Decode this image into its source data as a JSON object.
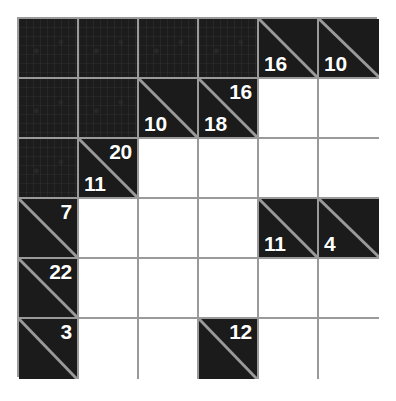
{
  "puzzle": {
    "type": "kakuro",
    "rows": 6,
    "cols": 6,
    "colors": {
      "block": "#1b1b1b",
      "cell": "#ffffff",
      "grid_line": "#9a9a9a",
      "clue_text": "#ffffff",
      "page_background": "#ffffff"
    },
    "grid": [
      [
        {
          "kind": "block",
          "across": "",
          "down": ""
        },
        {
          "kind": "block",
          "across": "",
          "down": ""
        },
        {
          "kind": "block",
          "across": "",
          "down": ""
        },
        {
          "kind": "block",
          "across": "",
          "down": ""
        },
        {
          "kind": "clue",
          "across": "",
          "down": "16"
        },
        {
          "kind": "clue",
          "across": "",
          "down": "10"
        }
      ],
      [
        {
          "kind": "block",
          "across": "",
          "down": ""
        },
        {
          "kind": "block",
          "across": "",
          "down": ""
        },
        {
          "kind": "clue",
          "across": "",
          "down": "10"
        },
        {
          "kind": "clue",
          "across": "16",
          "down": "18"
        },
        {
          "kind": "entry",
          "across": "",
          "down": ""
        },
        {
          "kind": "entry",
          "across": "",
          "down": ""
        }
      ],
      [
        {
          "kind": "block",
          "across": "",
          "down": ""
        },
        {
          "kind": "clue",
          "across": "20",
          "down": "11"
        },
        {
          "kind": "entry",
          "across": "",
          "down": ""
        },
        {
          "kind": "entry",
          "across": "",
          "down": ""
        },
        {
          "kind": "entry",
          "across": "",
          "down": ""
        },
        {
          "kind": "entry",
          "across": "",
          "down": ""
        }
      ],
      [
        {
          "kind": "clue",
          "across": "7",
          "down": ""
        },
        {
          "kind": "entry",
          "across": "",
          "down": ""
        },
        {
          "kind": "entry",
          "across": "",
          "down": ""
        },
        {
          "kind": "entry",
          "across": "",
          "down": ""
        },
        {
          "kind": "clue",
          "across": "",
          "down": "11"
        },
        {
          "kind": "clue",
          "across": "",
          "down": "4"
        }
      ],
      [
        {
          "kind": "clue",
          "across": "22",
          "down": ""
        },
        {
          "kind": "entry",
          "across": "",
          "down": ""
        },
        {
          "kind": "entry",
          "across": "",
          "down": ""
        },
        {
          "kind": "entry",
          "across": "",
          "down": ""
        },
        {
          "kind": "entry",
          "across": "",
          "down": ""
        },
        {
          "kind": "entry",
          "across": "",
          "down": ""
        }
      ],
      [
        {
          "kind": "clue",
          "across": "3",
          "down": ""
        },
        {
          "kind": "entry",
          "across": "",
          "down": ""
        },
        {
          "kind": "entry",
          "across": "",
          "down": ""
        },
        {
          "kind": "clue",
          "across": "12",
          "down": ""
        },
        {
          "kind": "entry",
          "across": "",
          "down": ""
        },
        {
          "kind": "entry",
          "across": "",
          "down": ""
        }
      ]
    ]
  }
}
